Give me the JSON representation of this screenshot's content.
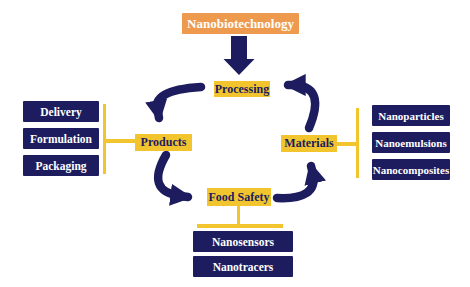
{
  "figure": {
    "title": "Nanobiotechnology"
  },
  "cycle": {
    "top": "Processing",
    "left": "Products",
    "bottom": "Food Safety",
    "right": "Materials"
  },
  "products_group": {
    "items": [
      "Delivery",
      "Formulation",
      "Packaging"
    ]
  },
  "materials_group": {
    "items": [
      "Nanoparticles",
      "Nanoemulsions",
      "Nanocomposites"
    ]
  },
  "food_safety_group": {
    "items": [
      "Nanosensors",
      "Nanotracers"
    ]
  },
  "colors": {
    "background": "#FFFFFF",
    "title_bg": "#EE9A4E",
    "title_text": "#FFFFFF",
    "label_bg": "#F2C52F",
    "label_text": "#1C1C5E",
    "box_bg": "#1C1C5E",
    "box_text": "#FFFFFF",
    "connector": "#F2C52F",
    "arrow": "#1C1C5E"
  }
}
